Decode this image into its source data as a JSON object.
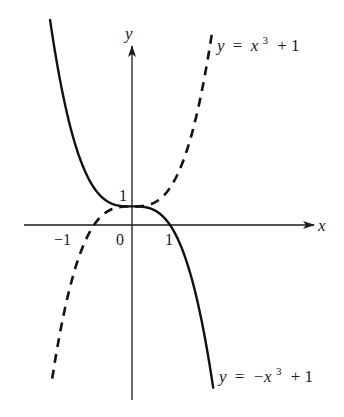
{
  "figure": {
    "axes": {
      "x_label": "x",
      "y_label": "y",
      "x_ticks": [
        "−1",
        "0",
        "1"
      ],
      "y_ticks": [
        "1"
      ]
    },
    "curves": [
      {
        "name": "cubic-plus-one",
        "label": "y = x³ + 1",
        "label_parts": {
          "lhs": "y",
          "eq": "=",
          "var": "x",
          "exp": "3",
          "rest": "+ 1"
        },
        "style": "dashed",
        "color": "#111111"
      },
      {
        "name": "neg-cubic-plus-one",
        "label": "y = −x³ + 1",
        "label_parts": {
          "lhs": "y",
          "eq": "=",
          "var": "−x",
          "exp": "3",
          "rest": "+ 1"
        },
        "style": "solid",
        "color": "#111111"
      }
    ]
  },
  "chart_data": {
    "type": "line",
    "title": "",
    "xlabel": "x",
    "ylabel": "y",
    "xlim": [
      -2.85,
      4.8
    ],
    "ylim": [
      -9.4,
      10.3
    ],
    "x_ticks": [
      -1,
      0,
      1
    ],
    "y_ticks": [
      1
    ],
    "grid": false,
    "legend": "inline labels at curve ends",
    "series": [
      {
        "name": "y = x^3 + 1",
        "style": "dashed",
        "x": [
          -2.1,
          -1.5,
          -1,
          -0.5,
          0,
          0.5,
          1,
          1.5,
          2.1
        ],
        "y": [
          -8.26,
          -2.38,
          0,
          0.88,
          1,
          1.13,
          2,
          4.38,
          10.26
        ]
      },
      {
        "name": "y = -x^3 + 1",
        "style": "solid",
        "x": [
          -2.16,
          -1.5,
          -1,
          -0.5,
          0,
          0.5,
          1,
          1.5,
          2.14
        ],
        "y": [
          11.08,
          4.38,
          2,
          1.13,
          1,
          0.88,
          0,
          -2.38,
          -8.8
        ]
      }
    ]
  }
}
